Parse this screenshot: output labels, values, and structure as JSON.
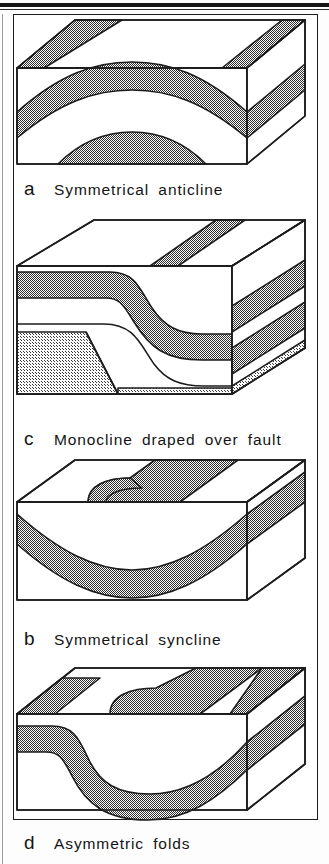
{
  "document": {
    "type": "geology-textbook-figure",
    "description": "Four three-dimensional block diagrams illustrating types of geological folds",
    "ink_color": "#1d1d1d",
    "paper_color": "#ffffff",
    "stipple_dark_color": "#4a4a4a",
    "stipple_light_color": "#b4b4b4"
  },
  "figures": [
    {
      "letter": "a",
      "title": "Symmetrical  anticline",
      "fold_type": "anticline",
      "symmetry": "symmetrical",
      "beds_shown": 2,
      "fault": false
    },
    {
      "letter": "c",
      "title": "Monocline  draped  over  fault",
      "fold_type": "monocline",
      "symmetry": "asymmetrical",
      "beds_shown": 2,
      "fault": true,
      "fault_style": "normal fault in stippled basement"
    },
    {
      "letter": "b",
      "title": "Symmetrical  syncline",
      "fold_type": "syncline",
      "symmetry": "symmetrical",
      "beds_shown": 1,
      "fault": false
    },
    {
      "letter": "d",
      "title": "Asymmetric  folds",
      "fold_type": "anticline-syncline pair",
      "symmetry": "asymmetric",
      "beds_shown": 2,
      "fault": false
    }
  ]
}
